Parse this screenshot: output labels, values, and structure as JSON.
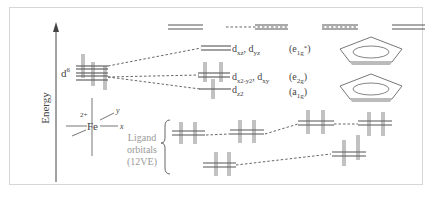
{
  "diagram": {
    "axis_label": "Energy",
    "metal": {
      "symbol": "Fe",
      "charge": "2+",
      "axis_x": "x",
      "axis_y": "y",
      "d_count_base": "d",
      "d_count_sup": "6"
    },
    "ligand_group": {
      "line1": "Ligand",
      "line2": "orbitals",
      "line3": "(12VE)"
    },
    "mo_levels": [
      {
        "id": "e1g_star",
        "orbital_label": "dxz, dyz",
        "orbital_base_1": "d",
        "orbital_sub_1": "xz",
        "sep": ", ",
        "orbital_base_2": "d",
        "orbital_sub_2": "yz",
        "symmetry_base": "(e",
        "symmetry_sub": "1g",
        "symmetry_sup": "*",
        "symmetry_close": ")"
      },
      {
        "id": "e2g",
        "orbital_label": "dx2-y2, dxy",
        "orbital_base_1": "d",
        "orbital_sub_1": "x2-y2",
        "sep": ", ",
        "orbital_base_2": "d",
        "orbital_sub_2": "xy",
        "symmetry_base": "(e",
        "symmetry_sub": "2g",
        "symmetry_close": ")"
      },
      {
        "id": "a1g",
        "orbital_label": "dz2",
        "orbital_base_1": "d",
        "orbital_sub_1": "z2",
        "symmetry_base": "(a",
        "symmetry_sub": "1g",
        "symmetry_close": ")"
      }
    ],
    "colors": {
      "frame_border": "#d6d6d6",
      "lines": "#555555",
      "text": "#444444",
      "ligand_text": "#999999",
      "ring_fill": "#c8c8c8"
    }
  }
}
